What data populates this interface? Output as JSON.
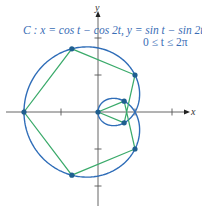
{
  "figure": {
    "caption_line1": "C : x = cos t − cos 2t, y = sin t − sin 2t,",
    "caption_line2": "0 ≤ t ≤ 2π",
    "x_axis_label": "x",
    "y_axis_label": "y",
    "colors": {
      "curve": "#2f6db8",
      "polygon": "#3aaa6a",
      "points": "#1f5f8f",
      "axes": "#555555",
      "caption": "#3a6db5"
    }
  },
  "diagram": {
    "curve_equation": {
      "x": "cos t − cos 2t",
      "y": "sin t − sin 2t",
      "t_range": [
        0,
        6.2832
      ]
    },
    "origin_px": [
      98,
      112
    ],
    "unit_px": 37,
    "x_ticks": [
      -2,
      -1,
      1,
      2
    ],
    "y_ticks": [
      -2,
      -1,
      1,
      2
    ],
    "marked_points": [
      {
        "t": "0",
        "x": 0,
        "y": 0
      },
      {
        "t": "π/4",
        "x": 0.707,
        "y": -0.293
      },
      {
        "t": "π/2",
        "x": 1,
        "y": 1
      },
      {
        "t": "3π/4",
        "x": -0.707,
        "y": 1.707
      },
      {
        "t": "π",
        "x": -2,
        "y": 0
      },
      {
        "t": "5π/4",
        "x": -0.707,
        "y": -1.707
      },
      {
        "t": "3π/2",
        "x": 1,
        "y": -1
      },
      {
        "t": "7π/4",
        "x": 0.707,
        "y": 0.293
      }
    ]
  }
}
